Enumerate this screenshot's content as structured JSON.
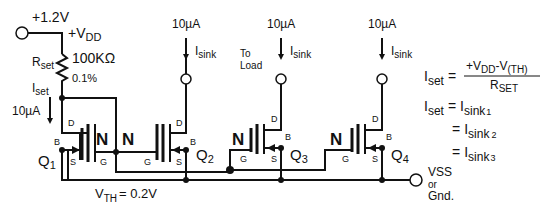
{
  "supply": {
    "voltage": "+1.2V",
    "vdd_label": "+V",
    "vdd_sub": "DD"
  },
  "resistor": {
    "label": "R",
    "label_sub": "set",
    "value": "100KΩ",
    "tolerance": "0.1%"
  },
  "iset": {
    "label": "I",
    "label_sub": "set",
    "current": "10µA"
  },
  "outputs": [
    {
      "current": "10µA",
      "label": "I",
      "label_sub": "sink"
    },
    {
      "current": "10µA",
      "label": "I",
      "label_sub": "sink",
      "note_line1": "To",
      "note_line2": "Load"
    },
    {
      "current": "10µA",
      "label": "I",
      "label_sub": "sink"
    }
  ],
  "transistors": [
    {
      "name": "Q",
      "sub": "1",
      "type": "N",
      "pins": {
        "d": "D",
        "g": "G",
        "s": "S",
        "b": "B"
      }
    },
    {
      "name": "Q",
      "sub": "2",
      "type": "N",
      "pins": {
        "d": "D",
        "g": "G",
        "s": "S",
        "b": "B"
      }
    },
    {
      "name": "Q",
      "sub": "3",
      "type": "N",
      "pins": {
        "d": "D",
        "g": "G",
        "s": "S",
        "b": "B"
      }
    },
    {
      "name": "Q",
      "sub": "4",
      "type": "N",
      "pins": {
        "d": "D",
        "g": "G",
        "s": "S",
        "b": "B"
      }
    }
  ],
  "vth": {
    "label": "V",
    "sub": "TH",
    "value": "= 0.2V"
  },
  "ground": {
    "line1": "VSS",
    "line2": "or",
    "line3": "Gnd."
  },
  "equations": {
    "eq1_lhs": "I",
    "eq1_lhs_sub": "set",
    "eq1_eq": "=",
    "eq1_num_a": "+V",
    "eq1_num_a_sub": "DD",
    "eq1_num_minus": "-V",
    "eq1_num_b_sub": "(TH)",
    "eq1_den": "R",
    "eq1_den_sub": "SET",
    "eq2_lhs": "I",
    "eq2_lhs_sub": "set",
    "eq2_eq": "=",
    "eq2_rhs": "I",
    "eq2_rhs_sub": "sink",
    "eq2_idx": "1",
    "eq3_eq": "=",
    "eq3_rhs": "I",
    "eq3_rhs_sub": "sink",
    "eq3_idx": "2",
    "eq4_eq": "=",
    "eq4_rhs": "I",
    "eq4_rhs_sub": "sink",
    "eq4_idx": "3"
  }
}
